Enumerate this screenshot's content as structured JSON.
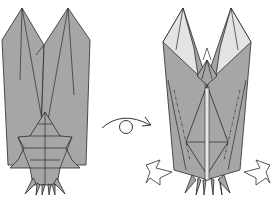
{
  "diagram": {
    "type": "origami-folding-instruction",
    "steps": [
      {
        "id": "before",
        "description": "Insect model, front view with wings and body"
      },
      {
        "id": "after",
        "description": "Insect model after turning over, with inside-reverse fold arrows at legs"
      }
    ],
    "symbols": [
      {
        "name": "turn-over-icon",
        "meaning": "Turn the model over"
      },
      {
        "name": "push-arrow-left",
        "meaning": "Push / reverse fold"
      },
      {
        "name": "push-arrow-right",
        "meaning": "Push / reverse fold"
      }
    ],
    "colors": {
      "paper": "#a6a6a6",
      "paper_light": "#e4e4e4",
      "line": "#2a2a2a",
      "background": "#ffffff"
    }
  }
}
